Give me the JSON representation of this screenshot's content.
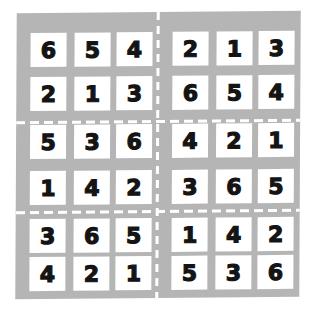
{
  "puzzle": {
    "type": "6x6 sudoku",
    "box_shape": "2 rows x 3 columns",
    "colors": {
      "board": "#b5b5b5",
      "cell": "#ffffff",
      "digit": "#141414",
      "divider": "#ffffff"
    },
    "grid": [
      [
        "6",
        "5",
        "4",
        "2",
        "1",
        "3"
      ],
      [
        "2",
        "1",
        "3",
        "6",
        "5",
        "4"
      ],
      [
        "5",
        "3",
        "6",
        "4",
        "2",
        "1"
      ],
      [
        "1",
        "4",
        "2",
        "3",
        "6",
        "5"
      ],
      [
        "3",
        "6",
        "5",
        "1",
        "4",
        "2"
      ],
      [
        "4",
        "2",
        "1",
        "5",
        "3",
        "6"
      ]
    ]
  }
}
